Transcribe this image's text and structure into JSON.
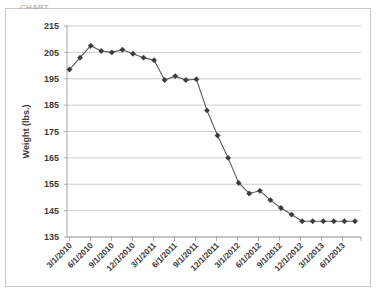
{
  "panel": {
    "cropped_title": "CHART",
    "border_color": "#c8c8c8",
    "background_color": "#ffffff"
  },
  "chart_data": {
    "type": "line",
    "title": "",
    "xlabel": "",
    "ylabel": "Weight (lbs.)",
    "ylim": [
      135,
      215
    ],
    "ytick_step": 10,
    "yticks": [
      215,
      205,
      195,
      185,
      175,
      165,
      155,
      145,
      135
    ],
    "grid": true,
    "legend": "none",
    "marker": "diamond",
    "line_color": "#5a5a5a",
    "marker_color": "#3a3a3a",
    "xtick_labels": [
      "3/1/2010",
      "6/1/2010",
      "9/1/2010",
      "12/1/2010",
      "3/1/2011",
      "6/1/2011",
      "9/1/2011",
      "12/1/2011",
      "3/1/2012",
      "6/1/2012",
      "9/1/2012",
      "12/1/2012",
      "3/1/2013",
      "6/1/2013"
    ],
    "x": [
      "3/1/2010",
      "5/1/2010",
      "7/1/2010",
      "8/15/2010",
      "9/15/2010",
      "11/1/2010",
      "12/1/2010",
      "1/15/2011",
      "3/1/2011",
      "5/15/2011",
      "6/15/2011",
      "8/1/2011",
      "9/1/2011",
      "10/15/2011",
      "12/1/2011",
      "1/15/2012",
      "3/1/2012",
      "4/15/2012",
      "6/1/2012",
      "7/15/2012",
      "9/1/2012",
      "10/1/2012",
      "11/1/2012",
      "12/15/2012",
      "2/1/2013",
      "3/15/2013",
      "5/1/2013",
      "6/15/2013"
    ],
    "values": [
      198.5,
      203,
      207.5,
      205.5,
      205,
      206,
      204.5,
      203,
      202,
      194.5,
      196,
      194.5,
      194.8,
      183,
      173.5,
      165,
      155.5,
      151.5,
      152.5,
      149,
      146,
      143.5,
      141,
      141,
      141,
      141,
      141,
      141
    ],
    "series": [
      {
        "name": "Weight",
        "points": [
          {
            "x": "3/1/2010",
            "y": 198.5
          },
          {
            "x": "5/1/2010",
            "y": 203
          },
          {
            "x": "7/1/2010",
            "y": 207.5
          },
          {
            "x": "8/10/2010",
            "y": 205.5
          },
          {
            "x": "9/10/2010",
            "y": 205
          },
          {
            "x": "10/25/2010",
            "y": 206
          },
          {
            "x": "12/5/2010",
            "y": 204.5
          },
          {
            "x": "1/10/2011",
            "y": 203
          },
          {
            "x": "2/20/2011",
            "y": 202
          },
          {
            "x": "4/20/2011",
            "y": 194.5
          },
          {
            "x": "5/25/2011",
            "y": 196
          },
          {
            "x": "7/25/2011",
            "y": 194.5
          },
          {
            "x": "9/15/2011",
            "y": 183
          },
          {
            "x": "11/5/2011",
            "y": 173.5
          },
          {
            "x": "12/25/2011",
            "y": 165
          },
          {
            "x": "2/20/2012",
            "y": 155.5
          },
          {
            "x": "4/15/2012",
            "y": 151.5
          },
          {
            "x": "5/25/2012",
            "y": 152.5
          },
          {
            "x": "7/10/2012",
            "y": 149
          },
          {
            "x": "9/1/2012",
            "y": 146
          },
          {
            "x": "10/20/2012",
            "y": 143.5
          },
          {
            "x": "12/10/2012",
            "y": 141
          }
        ]
      }
    ]
  }
}
